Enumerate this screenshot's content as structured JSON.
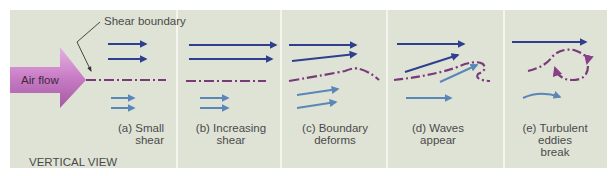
{
  "diagram": {
    "title_label": "Shear boundary",
    "inflow_label": "Air flow",
    "view_label": "VERTICAL VIEW",
    "colors": {
      "background": "#dfe3d6",
      "upper_arrow": "#2f3f8f",
      "lower_arrow": "#5a86b8",
      "boundary": "#7a3a7a",
      "airflow_arrow": "#c778c4"
    },
    "stages": [
      {
        "id": "a",
        "line1": "(a) Small",
        "line2": "shear",
        "line3": ""
      },
      {
        "id": "b",
        "line1": "(b) Increasing",
        "line2": "shear",
        "line3": ""
      },
      {
        "id": "c",
        "line1": "(c) Boundary",
        "line2": "deforms",
        "line3": ""
      },
      {
        "id": "d",
        "line1": "(d) Waves",
        "line2": "appear",
        "line3": ""
      },
      {
        "id": "e",
        "line1": "(e) Turbulent",
        "line2": "eddies",
        "line3": "break"
      }
    ]
  }
}
